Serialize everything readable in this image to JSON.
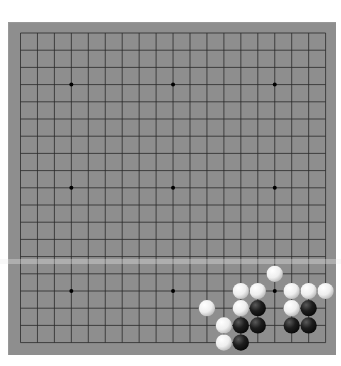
{
  "game": {
    "type": "go",
    "board_size": 19,
    "board_color": "#8e8e8e",
    "line_color": "#2a2a2a",
    "star_points": [
      [
        3,
        3
      ],
      [
        9,
        3
      ],
      [
        15,
        3
      ],
      [
        3,
        9
      ],
      [
        9,
        9
      ],
      [
        15,
        9
      ],
      [
        3,
        15
      ],
      [
        9,
        15
      ],
      [
        15,
        15
      ]
    ],
    "stones": {
      "white": [
        [
          11,
          16
        ],
        [
          13,
          15
        ],
        [
          14,
          15
        ],
        [
          13,
          16
        ],
        [
          12,
          17
        ],
        [
          12,
          18
        ],
        [
          15,
          14
        ],
        [
          16,
          15
        ],
        [
          17,
          15
        ],
        [
          18,
          15
        ],
        [
          16,
          16
        ]
      ],
      "black": [
        [
          14,
          16
        ],
        [
          13,
          17
        ],
        [
          14,
          17
        ],
        [
          13,
          18
        ],
        [
          16,
          17
        ],
        [
          17,
          16
        ],
        [
          17,
          17
        ]
      ]
    },
    "stone_colors": {
      "white": "#f2f2f2",
      "black": "#1a1a1a"
    }
  }
}
